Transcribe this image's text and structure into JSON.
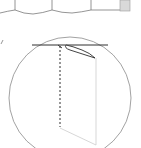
{
  "diagram": {
    "type": "technical-line-illustration",
    "colors": {
      "background": "#ffffff",
      "line": "#3a3a3a",
      "circle": "#8a8a8a",
      "faint_line": "#c8c8c8",
      "panel_line": "#7a7a7a",
      "shade": "#d9d9d9"
    },
    "top_fragment": {
      "description": "bottom edges of scalloped panels",
      "dividers_x": [
        15,
        52,
        91
      ],
      "shaded_panel": {
        "x": 120,
        "y": 0,
        "w": 10,
        "h": 11
      }
    },
    "detail_callout": {
      "shape": "circle",
      "cx": 70,
      "cy": 98,
      "r": 60,
      "leader_mark": {
        "x": 2,
        "y": 42
      },
      "elements": [
        {
          "name": "horizontal-edge-line",
          "x1": 32,
          "y1": 45,
          "x2": 108,
          "y2": 45
        },
        {
          "name": "dashed-fold-line",
          "x1": 60,
          "y1": 46,
          "x2": 60,
          "y2": 127
        },
        {
          "name": "folded-flap",
          "from": [
            63,
            46
          ],
          "to": [
            95,
            58
          ]
        },
        {
          "name": "faint-panel-outline"
        }
      ]
    }
  }
}
